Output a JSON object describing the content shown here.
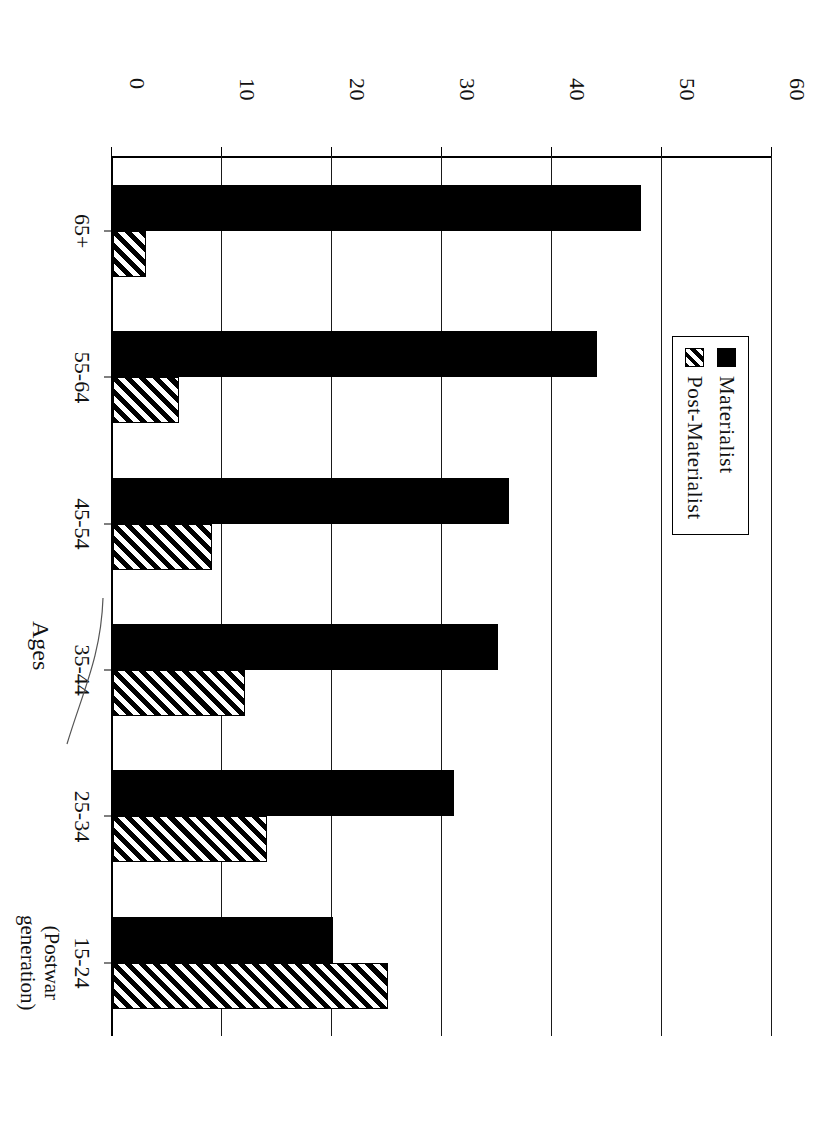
{
  "chart_data": {
    "type": "bar",
    "title": "",
    "subtitle": "",
    "xlabel": "Ages",
    "ylabel": "",
    "categories": [
      "65+",
      "55-64",
      "45-54",
      "35-44",
      "25-34",
      "15-24"
    ],
    "category_sublabels": [
      "",
      "",
      "",
      "",
      "",
      "(Postwar generation)"
    ],
    "series": [
      {
        "name": "Materialist",
        "values": [
          48,
          44,
          36,
          35,
          31,
          20
        ],
        "fill": "solid-black",
        "color": "#000000"
      },
      {
        "name": "Post-Materialist",
        "values": [
          3,
          6,
          9,
          12,
          14,
          25
        ],
        "fill": "diagonal-hatch",
        "color": "#000000"
      }
    ],
    "ylim": [
      0,
      60
    ],
    "yticks": [
      0,
      10,
      20,
      30,
      40,
      50,
      60
    ],
    "ytick_labels": [
      "0",
      "10",
      "20",
      "30",
      "40",
      "50",
      "60"
    ],
    "grid": true,
    "grid_axis": "value",
    "legend_position": "top-left",
    "orientation": "rotated-90-clockwise"
  },
  "legend": {
    "items": [
      {
        "label": "Materialist"
      },
      {
        "label": "Post-Materialist"
      }
    ]
  },
  "axis": {
    "x_title": "Ages",
    "tick_labels": [
      "0",
      "10",
      "20",
      "30",
      "40",
      "50",
      "60"
    ]
  },
  "categories": [
    {
      "label": "65+",
      "sub": ""
    },
    {
      "label": "55-64",
      "sub": ""
    },
    {
      "label": "45-54",
      "sub": ""
    },
    {
      "label": "35-44",
      "sub": ""
    },
    {
      "label": "25-34",
      "sub": ""
    },
    {
      "label": "15-24",
      "sub": "(Postwar\ngeneration)"
    }
  ]
}
